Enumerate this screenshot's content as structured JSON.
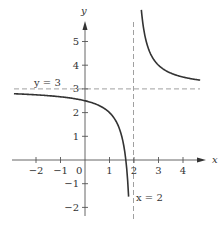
{
  "chart_data": {
    "type": "line",
    "title": "",
    "function": "y = 3 + 1/(x - 2)",
    "xlabel": "x",
    "ylabel": "y",
    "xlim": [
      -2.8,
      4.9
    ],
    "ylim": [
      -2.5,
      6.1
    ],
    "x_ticks": [
      -2,
      -1,
      0,
      1,
      2,
      3,
      4
    ],
    "x_tick_labels": [
      "−2",
      "−1",
      "0",
      "1",
      "2",
      "3",
      "4"
    ],
    "y_ticks": [
      -2,
      -1,
      1,
      2,
      3,
      4,
      5
    ],
    "y_tick_labels": [
      "−2",
      "−1",
      "1",
      "2",
      "3",
      "4",
      "5"
    ],
    "grid": false,
    "asymptotes": [
      {
        "type": "horizontal",
        "value": 3,
        "label": "y = 3",
        "style": "dashed"
      },
      {
        "type": "vertical",
        "value": 2,
        "label": "x = 2",
        "style": "dashed"
      }
    ],
    "series": [
      {
        "name": "left branch",
        "x": [
          -2.9,
          -2.5,
          -2,
          -1.5,
          -1,
          -0.5,
          0,
          0.5,
          1,
          1.25,
          1.5,
          1.6,
          1.7,
          1.75,
          1.8
        ],
        "y": [
          2.8,
          2.78,
          2.75,
          2.71,
          2.67,
          2.6,
          2.5,
          2.33,
          2.0,
          1.67,
          1.0,
          0.5,
          -0.33,
          -1.0,
          -2.0
        ]
      },
      {
        "name": "right branch",
        "x": [
          2.3,
          2.4,
          2.5,
          2.75,
          3,
          3.5,
          4,
          4.5,
          4.7
        ],
        "y": [
          6.33,
          5.5,
          5.0,
          4.33,
          4.0,
          3.67,
          3.5,
          3.4,
          3.37
        ]
      }
    ],
    "colors": {
      "curve": "#333333",
      "axis": "#555555",
      "asymptote": "#888888"
    }
  },
  "labels": {
    "x_axis": "x",
    "y_axis": "y",
    "h_asymptote": "y = 3",
    "v_asymptote": "x = 2",
    "origin": "0"
  }
}
